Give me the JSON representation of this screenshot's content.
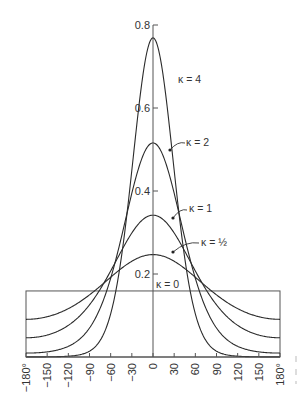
{
  "chart_data": {
    "type": "line",
    "title": "",
    "xlabel": "",
    "ylabel": "",
    "xlim": [
      -180,
      180
    ],
    "ylim": [
      0,
      0.8
    ],
    "grid": false,
    "legend": "inline labels with arrows",
    "x_ticks": [
      -180,
      -150,
      -120,
      -90,
      -60,
      -30,
      0,
      30,
      60,
      90,
      120,
      150,
      180
    ],
    "x_tick_labels": [
      "−180°",
      "−150",
      "−120",
      "−90",
      "−60",
      "−30",
      "0",
      "30",
      "60",
      "90",
      "120",
      "150",
      "180°"
    ],
    "y_ticks": [
      0.2,
      0.4,
      0.6,
      0.8
    ],
    "y_tick_labels": [
      "0.2",
      "0.4",
      "0.6",
      "0.8"
    ],
    "distribution": "von Mises density f(θ) = exp(κ cos θ) / (2π I0(κ))",
    "series": [
      {
        "name": "κ=0",
        "kappa": 0,
        "peak": 0.159,
        "label": "κ=0"
      },
      {
        "name": "κ=½",
        "kappa": 0.5,
        "peak": 0.25,
        "label": "κ=½"
      },
      {
        "name": "κ=1",
        "kappa": 1,
        "peak": 0.34,
        "label": "κ=1"
      },
      {
        "name": "κ=2",
        "kappa": 2,
        "peak": 0.48,
        "label": "κ=2"
      },
      {
        "name": "κ=4",
        "kappa": 4,
        "peak": 0.76,
        "label": "κ=4"
      }
    ],
    "sample_points": {
      "x": [
        -180,
        -150,
        -120,
        -90,
        -60,
        -30,
        0,
        30,
        60,
        90,
        120,
        150,
        180
      ],
      "κ=0": [
        0.159,
        0.159,
        0.159,
        0.159,
        0.159,
        0.159,
        0.159,
        0.159,
        0.159,
        0.159,
        0.159,
        0.159,
        0.159
      ],
      "κ=½": [
        0.09,
        0.096,
        0.116,
        0.149,
        0.191,
        0.229,
        0.246,
        0.229,
        0.191,
        0.149,
        0.116,
        0.096,
        0.09
      ],
      "κ=1": [
        0.046,
        0.053,
        0.075,
        0.125,
        0.205,
        0.296,
        0.342,
        0.296,
        0.205,
        0.125,
        0.075,
        0.053,
        0.046
      ],
      "κ=2": [
        0.009,
        0.012,
        0.024,
        0.069,
        0.187,
        0.389,
        0.51,
        0.389,
        0.187,
        0.069,
        0.024,
        0.012,
        0.009
      ],
      "κ=4": [
        0.0004,
        0.0006,
        0.003,
        0.02,
        0.147,
        0.489,
        1.0,
        0.489,
        0.147,
        0.02,
        0.003,
        0.0006,
        0.0004
      ]
    }
  },
  "labels": {
    "k4": "κ = 4",
    "k2": "κ = 2",
    "k1": "κ = 1",
    "khalf": "κ = ½",
    "k0": "κ = 0"
  }
}
